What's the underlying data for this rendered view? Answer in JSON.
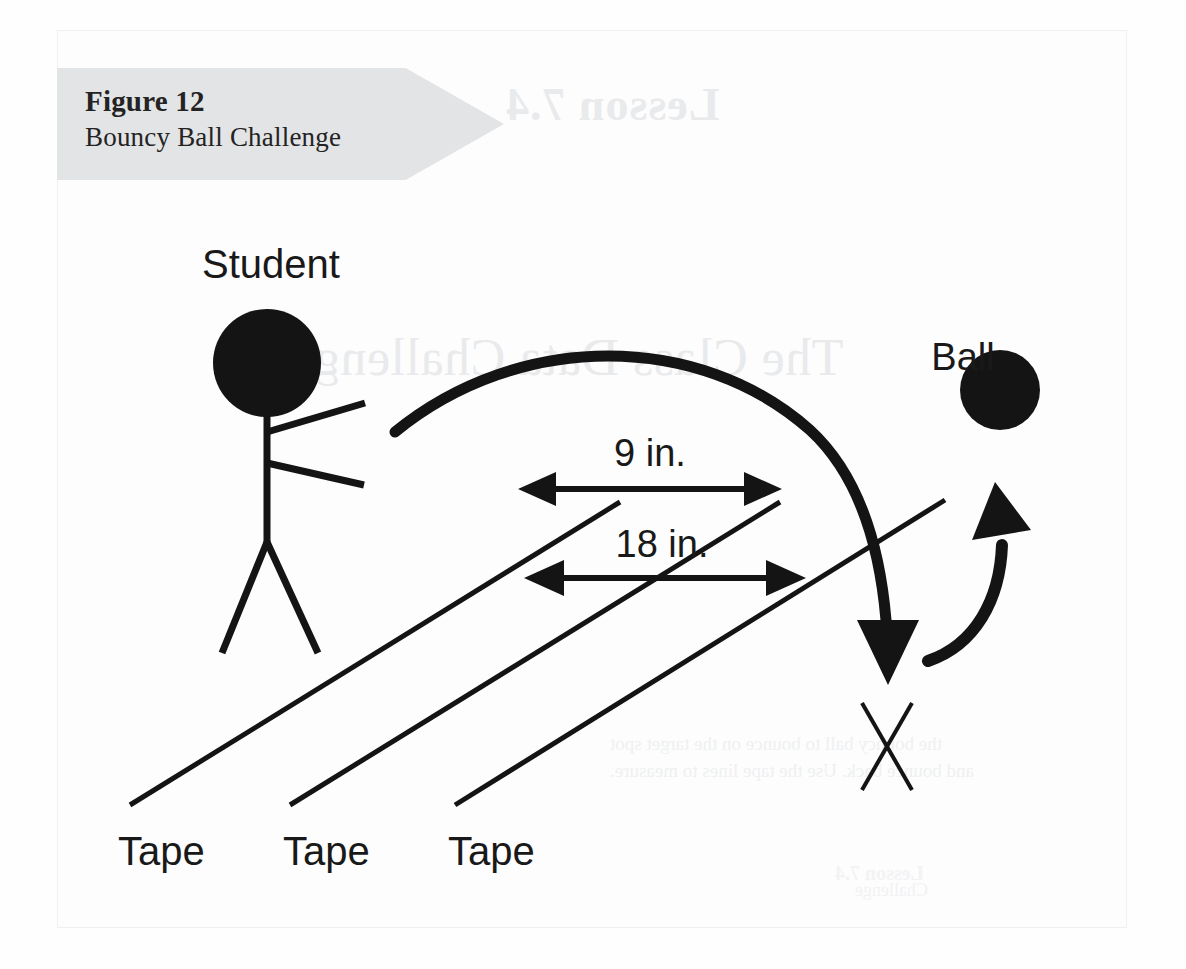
{
  "figure": {
    "banner": {
      "number_label": "Figure 12",
      "title": "Bouncy Ball Challenge",
      "background_color": "#e3e4e6",
      "text_color": "#232323"
    },
    "frame": {
      "border_color": "#f0f0f0",
      "page_background": "#fdfdfd"
    }
  },
  "diagram": {
    "type": "illustration",
    "ink_color": "#141414",
    "labels": {
      "student": "Student",
      "ball": "Ball",
      "measurement_short": "9 in.",
      "measurement_long": "18 in.",
      "tape_1": "Tape",
      "tape_2": "Tape",
      "tape_3": "Tape"
    },
    "elements": {
      "student_figure": "stick-figure",
      "ball": "filled-circle",
      "throw_arc": "curved-trajectory-arrow-down",
      "bounce_arc": "curved-rebound-arrow-up",
      "target_mark": "x-mark",
      "tape_lines": 3,
      "dimension_arrows": 2
    },
    "measurements": [
      {
        "label": "9 in.",
        "description": "distance between the second and third tape lines"
      },
      {
        "label": "18 in.",
        "description": "distance between the first and third tape lines"
      }
    ]
  },
  "bleed_through": {
    "lesson": "Lesson 7.4",
    "heading": "The Class Data Challenge",
    "body_line_1": "the bouncy ball to bounce on the target spot",
    "body_line_2": "and bounce back. Use the tape lines to measure.",
    "side_note": "Lesson 7.4",
    "footer": "Challenge"
  }
}
